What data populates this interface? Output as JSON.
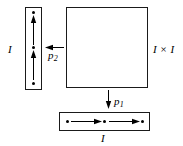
{
  "figure": {
    "background_color": "#ffffff",
    "stroke_color": "#000000"
  },
  "labels": {
    "left_interval": "I",
    "bottom_interval": "I",
    "square": "I × I",
    "projection_1_base": "p",
    "projection_1_sub": "1",
    "projection_2_base": "p",
    "projection_2_sub": "2"
  },
  "shapes": {
    "vertical_interval": {
      "name": "vertical-interval",
      "orientation": "vertical",
      "dots": 3,
      "arrows": 2,
      "arrow_direction": "up"
    },
    "product_square": {
      "name": "product-square",
      "orientation": "square",
      "dots": 0,
      "arrows": 0
    },
    "horizontal_interval": {
      "name": "horizontal-interval",
      "orientation": "horizontal",
      "dots": 3,
      "arrows": 2,
      "arrow_direction": "right"
    }
  },
  "maps": [
    {
      "name": "p1",
      "from": "product-square",
      "to": "horizontal-interval",
      "direction": "down"
    },
    {
      "name": "p2",
      "from": "product-square",
      "to": "vertical-interval",
      "direction": "left"
    }
  ]
}
